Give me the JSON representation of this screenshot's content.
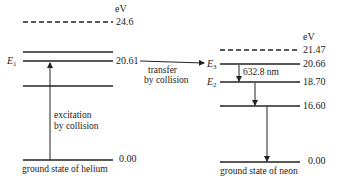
{
  "unit_label": "eV",
  "helium": {
    "levels": [
      {
        "value": "24.6",
        "style": "dashed",
        "label": ""
      },
      {
        "value": "",
        "style": "solid",
        "label": ""
      },
      {
        "value": "20.61",
        "style": "solid",
        "label": "E1"
      },
      {
        "value": "",
        "style": "solid",
        "label": ""
      },
      {
        "value": "0.00",
        "style": "solid",
        "label": ""
      }
    ],
    "excitation_text": [
      "excitation",
      "by collision"
    ],
    "ground_caption": "ground state of helium"
  },
  "transfer_text": [
    "transfer",
    "by collision"
  ],
  "neon": {
    "levels": [
      {
        "value": "21.47",
        "style": "dashed",
        "label": ""
      },
      {
        "value": "20.66",
        "style": "solid",
        "label": "E3"
      },
      {
        "value": "18.70",
        "style": "solid",
        "label": "E2"
      },
      {
        "value": "16.60",
        "style": "solid",
        "label": ""
      },
      {
        "value": "0.00",
        "style": "solid",
        "label": ""
      }
    ],
    "wavelength_label": "632.8 nm",
    "ground_caption": "ground state of neon"
  }
}
